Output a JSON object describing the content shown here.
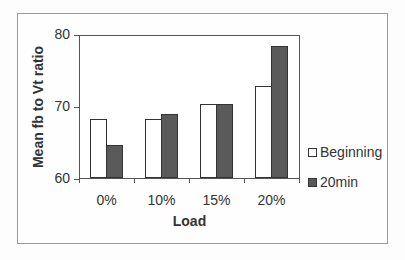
{
  "chart_data": {
    "type": "bar",
    "title": "",
    "xlabel": "Load",
    "ylabel": "Mean fb to Vt ratio",
    "categories": [
      "0%",
      "10%",
      "15%",
      "20%"
    ],
    "series": [
      {
        "name": "Beginning",
        "color": "#ffffff",
        "values": [
          68.3,
          68.2,
          70.3,
          72.9
        ]
      },
      {
        "name": "20min",
        "color": "#5a5a5a",
        "values": [
          64.6,
          68.9,
          70.3,
          78.5
        ]
      }
    ],
    "ylim": [
      60,
      80
    ],
    "yticks": [
      "60",
      "70",
      "80"
    ],
    "grid": false,
    "legend_position": "right"
  }
}
